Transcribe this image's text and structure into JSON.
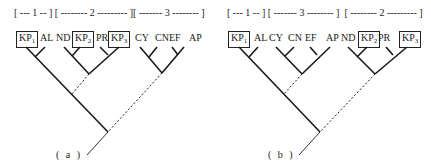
{
  "figure": {
    "panels": [
      {
        "id": "a",
        "caption": "( a )",
        "header": "[ --- 1 -- ] [ -------- 2 --------- ][ ------- 3 -------- ]",
        "groups": [
          {
            "label": "1",
            "members": [
              "KP1",
              "AL"
            ]
          },
          {
            "label": "2",
            "members": [
              "ND",
              "KP2",
              "PR",
              "KP3"
            ]
          },
          {
            "label": "3",
            "members": [
              "CY",
              "CN",
              "EF",
              "AP"
            ]
          }
        ],
        "leaves": [
          {
            "name": "KP",
            "sub": "1",
            "boxed": true
          },
          {
            "name": "AL",
            "sub": "",
            "boxed": false
          },
          {
            "name": "ND",
            "sub": "",
            "boxed": false
          },
          {
            "name": "KP",
            "sub": "2",
            "boxed": true
          },
          {
            "name": "PR",
            "sub": "",
            "boxed": false
          },
          {
            "name": "KP",
            "sub": "3",
            "boxed": true
          },
          {
            "name": "CY",
            "sub": "",
            "boxed": false
          },
          {
            "name": "CN",
            "sub": "",
            "boxed": false
          },
          {
            "name": "EF",
            "sub": "",
            "boxed": false
          },
          {
            "name": "AP",
            "sub": "",
            "boxed": false
          }
        ]
      },
      {
        "id": "b",
        "caption": "( b )",
        "header": "[ --- 1 -- ] [ ------- 3 -------- ]  [ -------- 2 --------- ]",
        "groups": [
          {
            "label": "1",
            "members": [
              "KP1",
              "AL"
            ]
          },
          {
            "label": "3",
            "members": [
              "CY",
              "CN",
              "EF",
              "AP"
            ]
          },
          {
            "label": "2",
            "members": [
              "ND",
              "KP2",
              "PR",
              "KP3"
            ]
          }
        ],
        "leaves": [
          {
            "name": "KP",
            "sub": "1",
            "boxed": true
          },
          {
            "name": "AL",
            "sub": "",
            "boxed": false
          },
          {
            "name": "CY",
            "sub": "",
            "boxed": false
          },
          {
            "name": "CN",
            "sub": "",
            "boxed": false
          },
          {
            "name": "EF",
            "sub": "",
            "boxed": false
          },
          {
            "name": "AP",
            "sub": "",
            "boxed": false
          },
          {
            "name": "ND",
            "sub": "",
            "boxed": false
          },
          {
            "name": "KP",
            "sub": "2",
            "boxed": true
          },
          {
            "name": "PR",
            "sub": "",
            "boxed": false
          },
          {
            "name": "KP",
            "sub": "3",
            "boxed": true
          }
        ]
      }
    ],
    "colors": {
      "line": "#1a1a1a",
      "background": "#ffffff"
    }
  }
}
